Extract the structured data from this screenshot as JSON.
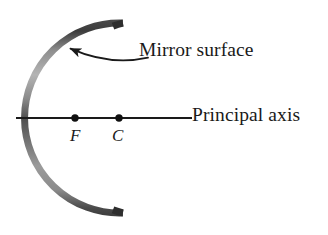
{
  "figure": {
    "type": "optics-ray-diagram",
    "width": 328,
    "height": 235,
    "background_color": "#ffffff"
  },
  "labels": {
    "mirror_surface": "Mirror surface",
    "principal_axis": "Principal axis",
    "focal_point": "F",
    "center_of_curvature": "C"
  },
  "colors": {
    "ink": "#1a1a1a",
    "mirror_dark": "#3a3a3a",
    "mirror_mid": "#6e6e6e",
    "mirror_light": "#a8a8a8",
    "axis_line": "#1a1a1a"
  },
  "geometry": {
    "mirror_arc": {
      "center_x": 120,
      "center_y": 118,
      "radius": 95,
      "start_angle_deg": 168,
      "end_angle_deg": 192,
      "stroke_width": 7,
      "vertex_x": 25,
      "vertex_y": 118,
      "top_end_x": 122,
      "top_end_y": 19,
      "bottom_end_x": 122,
      "bottom_end_y": 218
    },
    "principal_axis": {
      "x1": 16,
      "y1": 118,
      "x2": 192,
      "y2": 118,
      "stroke_width": 1.8
    },
    "points": [
      {
        "name": "F",
        "x": 75,
        "y": 118,
        "radius": 3.6
      },
      {
        "name": "C",
        "x": 119,
        "y": 118,
        "radius": 3.6
      }
    ],
    "pointer_arrow": {
      "tail_x": 148,
      "tail_y": 56,
      "tip_x": 64,
      "tip_y": 46,
      "curved": true,
      "head_angle_deg": 200
    }
  }
}
